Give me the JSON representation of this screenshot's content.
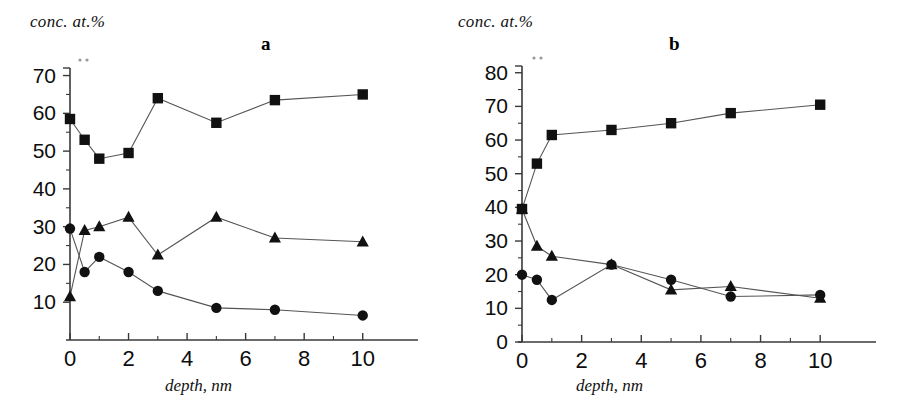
{
  "figure": {
    "panels": [
      {
        "letter": "a",
        "ylabel": "conc. at.%",
        "xlabel": "depth, nm"
      },
      {
        "letter": "b",
        "ylabel": "conc. at.%",
        "xlabel": "depth, nm"
      }
    ]
  },
  "chart_data": [
    {
      "type": "line",
      "title": "a",
      "xlabel": "depth, nm",
      "ylabel": "conc. at.%",
      "xlim": [
        0,
        11
      ],
      "ylim": [
        0,
        72
      ],
      "xticks": [
        0,
        2,
        4,
        6,
        8,
        10
      ],
      "yticks": [
        10,
        20,
        30,
        40,
        50,
        60,
        70
      ],
      "ytick_labels": [
        "10",
        "20",
        "30",
        "40",
        "50",
        "60",
        "70"
      ],
      "xtick_labels": [
        "0",
        "2",
        "4",
        "6",
        "8",
        "10"
      ],
      "grid": false,
      "legend": "none",
      "x": [
        0,
        0.5,
        1,
        2,
        3,
        5,
        7,
        10
      ],
      "series": [
        {
          "name": "squares",
          "marker": "square",
          "values": [
            58.5,
            53,
            48,
            49.5,
            64,
            57.5,
            63.5,
            65
          ]
        },
        {
          "name": "triangles",
          "marker": "triangle",
          "values": [
            11.5,
            29,
            30,
            32.5,
            22.5,
            32.5,
            27,
            26
          ]
        },
        {
          "name": "circles",
          "marker": "circle",
          "values": [
            29.5,
            18,
            22,
            18,
            13,
            8.5,
            8,
            6.5
          ]
        }
      ]
    },
    {
      "type": "line",
      "title": "b",
      "xlabel": "depth, nm",
      "ylabel": "conc. at.%",
      "xlim": [
        0,
        11
      ],
      "ylim": [
        0,
        82
      ],
      "xticks": [
        0,
        2,
        4,
        6,
        8,
        10
      ],
      "yticks": [
        0,
        10,
        20,
        30,
        40,
        50,
        60,
        70,
        80
      ],
      "ytick_labels": [
        "0",
        "10",
        "20",
        "30",
        "40",
        "50",
        "60",
        "70",
        "80"
      ],
      "xtick_labels": [
        "0",
        "2",
        "4",
        "6",
        "8",
        "10"
      ],
      "grid": false,
      "legend": "none",
      "x": [
        0,
        0.5,
        1,
        3,
        5,
        7,
        10
      ],
      "series": [
        {
          "name": "squares",
          "marker": "square",
          "values": [
            39.5,
            53,
            61.5,
            63,
            65,
            68,
            70.5
          ]
        },
        {
          "name": "triangles",
          "marker": "triangle",
          "values": [
            39.5,
            28.5,
            25.5,
            23,
            15.5,
            16.5,
            13
          ]
        },
        {
          "name": "circles",
          "marker": "circle",
          "values": [
            20,
            18.5,
            12.5,
            23,
            18.5,
            13.5,
            14
          ]
        }
      ]
    }
  ]
}
